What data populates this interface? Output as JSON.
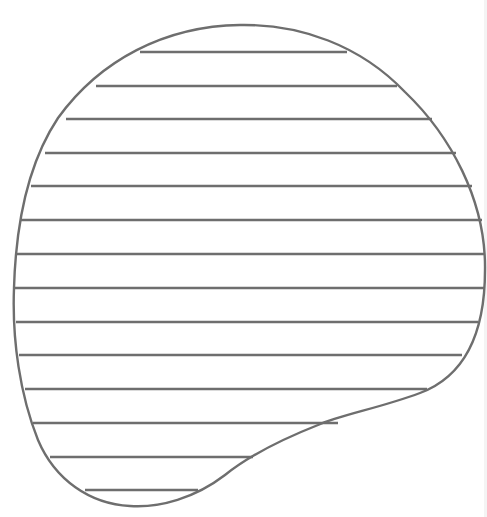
{
  "figure": {
    "stroke_color": "#6e6e6e",
    "background_color": "#ffffff",
    "stroke_width": 2.4,
    "outline_path": "M 240 25 C 300 24, 360 45, 405 92 C 450 135, 486 200, 485 270 C 485 340, 460 378, 420 393 C 380 408, 340 415, 318 425 C 280 440, 250 455, 225 475 C 195 498, 160 508, 130 506 C 90 504, 55 480, 38 440 C 20 395, 12 340, 14 288 C 16 220, 30 160, 58 118 C 100 60, 165 26, 240 25 Z",
    "hatch_lines": [
      {
        "y": 52,
        "x1": 140,
        "x2": 347
      },
      {
        "y": 86,
        "x1": 96,
        "x2": 397
      },
      {
        "y": 119,
        "x1": 66,
        "x2": 432
      },
      {
        "y": 153,
        "x1": 45,
        "x2": 456
      },
      {
        "y": 186,
        "x1": 31,
        "x2": 472
      },
      {
        "y": 220,
        "x1": 21,
        "x2": 482
      },
      {
        "y": 254,
        "x1": 16,
        "x2": 485
      },
      {
        "y": 288,
        "x1": 14,
        "x2": 485
      },
      {
        "y": 322,
        "x1": 16,
        "x2": 478
      },
      {
        "y": 355,
        "x1": 19,
        "x2": 462
      },
      {
        "y": 389,
        "x1": 25,
        "x2": 427
      },
      {
        "y": 423,
        "x1": 33,
        "x2": 338
      },
      {
        "y": 457,
        "x1": 50,
        "x2": 253
      },
      {
        "y": 490,
        "x1": 85,
        "x2": 198
      }
    ]
  }
}
